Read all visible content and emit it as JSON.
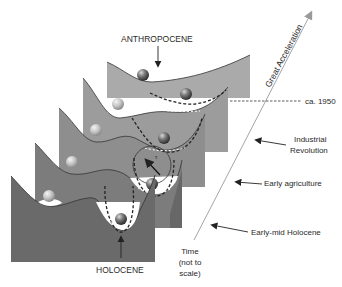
{
  "labels": {
    "top_epoch": "ANTHROPOCENE",
    "bottom_epoch": "HOLOCENE",
    "axis_upper": "Great Acceleration",
    "marker_1950": "ca. 1950",
    "industrial_line1": "Industrial",
    "industrial_line2": "Revolution",
    "early_agriculture": "Early agriculture",
    "early_mid_holocene": "Early-mid Holocene",
    "time_line1": "Time",
    "time_line2": "(not to",
    "time_line3": "scale)",
    "tau_symbol": "τ"
  },
  "colors": {
    "panel_1": "#aaaaaa",
    "panel_2": "#9c9c9c",
    "panel_3": "#8e8e8e",
    "panel_4": "#7c7c7c",
    "panel_5": "#6a6a6a",
    "axis": "#8a8a8a",
    "text": "#2a2a2a"
  },
  "panels": [
    {
      "id": 1,
      "name": "anthropocene-state"
    },
    {
      "id": 2,
      "name": "great-acceleration-state"
    },
    {
      "id": 3,
      "name": "industrial-revolution-state"
    },
    {
      "id": 4,
      "name": "early-agriculture-state"
    },
    {
      "id": 5,
      "name": "holocene-state"
    }
  ]
}
